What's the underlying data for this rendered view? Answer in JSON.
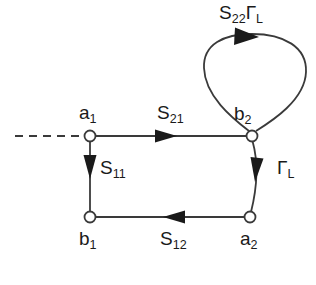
{
  "diagram": {
    "type": "signal-flow-graph",
    "background_color": "#ffffff",
    "line_color": "#3a3a3a",
    "text_color": "#1a1a1a",
    "node_fill": "#ffffff",
    "nodes": [
      {
        "id": "a1",
        "label_main": "a",
        "label_sub": "1",
        "x": 90,
        "y": 136
      },
      {
        "id": "b2",
        "label_main": "b",
        "label_sub": "2",
        "x": 252,
        "y": 136
      },
      {
        "id": "b1",
        "label_main": "b",
        "label_sub": "1",
        "x": 90,
        "y": 217
      },
      {
        "id": "a2",
        "label_main": "a",
        "label_sub": "2",
        "x": 250,
        "y": 217
      }
    ],
    "edges": [
      {
        "id": "s21",
        "from": "a1",
        "to": "b2",
        "label_main": "S",
        "label_sub": "21",
        "direction": "right"
      },
      {
        "id": "s11",
        "from": "a1",
        "to": "b1",
        "label_main": "S",
        "label_sub": "11",
        "direction": "down"
      },
      {
        "id": "s12",
        "from": "a2",
        "to": "b1",
        "label_main": "S",
        "label_sub": "12",
        "direction": "left"
      },
      {
        "id": "gammaL",
        "from": "b2",
        "to": "a2",
        "label_main": "Γ",
        "label_sub": "L",
        "direction": "down"
      },
      {
        "id": "s22gammaL",
        "from": "b2",
        "to": "b2",
        "label_main": "S",
        "label_sub": "22",
        "label_main2": "Γ",
        "label_sub2": "L",
        "direction": "self-loop"
      }
    ],
    "input_line": {
      "id": "input-dashed",
      "style": "dashed",
      "from_x": 15,
      "to_x": 85,
      "y": 136
    }
  }
}
